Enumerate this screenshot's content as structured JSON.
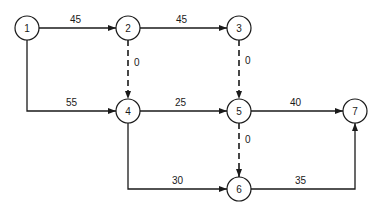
{
  "diagram": {
    "type": "activity-network",
    "nodes": [
      {
        "id": "1",
        "label": "1",
        "x": 27,
        "y": 28
      },
      {
        "id": "2",
        "label": "2",
        "x": 128,
        "y": 28
      },
      {
        "id": "3",
        "label": "3",
        "x": 239,
        "y": 28
      },
      {
        "id": "4",
        "label": "4",
        "x": 128,
        "y": 111
      },
      {
        "id": "5",
        "label": "5",
        "x": 239,
        "y": 111
      },
      {
        "id": "6",
        "label": "6",
        "x": 239,
        "y": 189
      },
      {
        "id": "7",
        "label": "7",
        "x": 355,
        "y": 111
      }
    ],
    "edges": [
      {
        "from": "1",
        "to": "2",
        "label": "45",
        "style": "solid"
      },
      {
        "from": "2",
        "to": "3",
        "label": "45",
        "style": "solid"
      },
      {
        "from": "2",
        "to": "4",
        "label": "0",
        "style": "dashed"
      },
      {
        "from": "3",
        "to": "5",
        "label": "0",
        "style": "dashed"
      },
      {
        "from": "1",
        "to": "4",
        "label": "55",
        "style": "solid"
      },
      {
        "from": "4",
        "to": "5",
        "label": "25",
        "style": "solid"
      },
      {
        "from": "5",
        "to": "7",
        "label": "40",
        "style": "solid"
      },
      {
        "from": "5",
        "to": "6",
        "label": "0",
        "style": "dashed"
      },
      {
        "from": "4",
        "to": "6",
        "label": "30",
        "style": "solid"
      },
      {
        "from": "6",
        "to": "7",
        "label": "35",
        "style": "solid"
      }
    ]
  }
}
